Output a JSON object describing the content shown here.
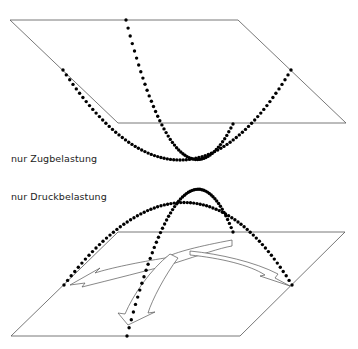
{
  "labels": {
    "tension": "nur Zugbelastung",
    "compression": "nur Druckbelastung"
  },
  "colors": {
    "line": "#555555",
    "dots": "#000000",
    "background": "#ffffff"
  },
  "top_plane": [
    [
      10,
      20
    ],
    [
      238,
      20
    ],
    [
      346,
      123
    ],
    [
      118,
      123
    ]
  ],
  "bottom_plane": [
    [
      118,
      232
    ],
    [
      345,
      232
    ],
    [
      240,
      336
    ],
    [
      11,
      336
    ]
  ],
  "top_curves": [
    {
      "from": [
        63,
        70
      ],
      "ctrl": [
        183,
        250
      ],
      "to": [
        291,
        70
      ]
    },
    {
      "from": [
        126,
        20
      ],
      "ctrl": [
        180,
        230
      ],
      "to": [
        233,
        124
      ]
    }
  ],
  "bottom_curves": [
    {
      "from": [
        64,
        285
      ],
      "ctrl": [
        190,
        120
      ],
      "to": [
        292,
        285
      ]
    },
    {
      "from": [
        127,
        336
      ],
      "ctrl": [
        185,
        110
      ],
      "to": [
        233,
        232
      ]
    }
  ]
}
